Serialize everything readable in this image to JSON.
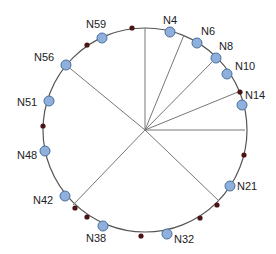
{
  "diagram": {
    "type": "chord-ring",
    "center": [
      145,
      130
    ],
    "radius": 102,
    "colors": {
      "ring": "#555555",
      "chord": "#777777",
      "node_fill": "#8fb0dc",
      "node_stroke": "#4a6f9e",
      "key_dot": "#4a1414",
      "label": "#222222"
    },
    "nodes": [
      {
        "id": "N4",
        "x": 170,
        "y": 32,
        "lx": 163,
        "ly": 24
      },
      {
        "id": "N6",
        "x": 197,
        "y": 43,
        "lx": 201,
        "ly": 35
      },
      {
        "id": "N8",
        "x": 216,
        "y": 58,
        "lx": 219,
        "ly": 50
      },
      {
        "id": "N10",
        "x": 227,
        "y": 74,
        "lx": 235,
        "ly": 70
      },
      {
        "id": "N14",
        "x": 242,
        "y": 105,
        "lx": 245,
        "ly": 99
      },
      {
        "id": "N21",
        "x": 230,
        "y": 186,
        "lx": 237,
        "ly": 190
      },
      {
        "id": "N32",
        "x": 167,
        "y": 234,
        "lx": 174,
        "ly": 243
      },
      {
        "id": "N38",
        "x": 103,
        "y": 226,
        "lx": 86,
        "ly": 242
      },
      {
        "id": "N42",
        "x": 65,
        "y": 196,
        "lx": 33,
        "ly": 204
      },
      {
        "id": "N48",
        "x": 45,
        "y": 151,
        "lx": 17,
        "ly": 159
      },
      {
        "id": "N51",
        "x": 49,
        "y": 101,
        "lx": 17,
        "ly": 106
      },
      {
        "id": "N56",
        "x": 66,
        "y": 65,
        "lx": 34,
        "ly": 61
      },
      {
        "id": "N59",
        "x": 102,
        "y": 38,
        "lx": 86,
        "ly": 28
      }
    ],
    "key_dots": [
      {
        "x": 132,
        "y": 28
      },
      {
        "x": 87,
        "y": 45
      },
      {
        "x": 43,
        "y": 126
      },
      {
        "x": 244,
        "y": 155
      },
      {
        "x": 217,
        "y": 205
      },
      {
        "x": 200,
        "y": 218
      },
      {
        "x": 141,
        "y": 236
      },
      {
        "x": 75,
        "y": 208
      },
      {
        "x": 87,
        "y": 217
      },
      {
        "x": 240,
        "y": 92
      }
    ],
    "chords": [
      {
        "to": [
          145,
          28
        ]
      },
      {
        "to": [
          184,
          35
        ]
      },
      {
        "to": [
          212,
          62
        ]
      },
      {
        "to": [
          238,
          92
        ]
      },
      {
        "to": [
          245,
          130
        ]
      },
      {
        "to": [
          219,
          201
        ]
      },
      {
        "to": [
          66,
          65
        ]
      },
      {
        "to": [
          73,
          205
        ]
      }
    ]
  }
}
